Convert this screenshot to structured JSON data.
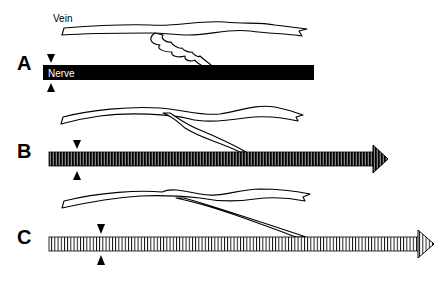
{
  "figure": {
    "type": "anatomical schematic",
    "labels": {
      "vein": "Vein",
      "nerve": "Nerve"
    },
    "panels": [
      {
        "id": "A",
        "label": "A",
        "nerve_style": "solid black bar",
        "arrowhead": false,
        "vein_contact": "tortuous branch touching nerve",
        "marker_x": 43
      },
      {
        "id": "B",
        "label": "B",
        "nerve_style": "dense dark striped bar",
        "arrowhead": true,
        "vein_contact": "smooth branch touching nerve",
        "marker_x": 76
      },
      {
        "id": "C",
        "label": "C",
        "nerve_style": "light striped bar",
        "arrowhead": true,
        "vein_contact": "long straight branch touching nerve",
        "marker_x": 101
      }
    ],
    "colors": {
      "background": "#ffffff",
      "ink": "#000000"
    }
  }
}
